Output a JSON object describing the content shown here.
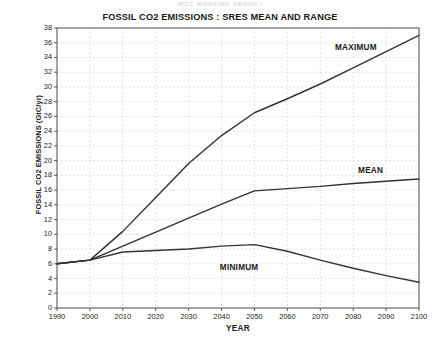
{
  "figure": {
    "faint_header": "IPCC WORKING GROUP I",
    "title": "FOSSIL CO2 EMISSIONS : SRES MEAN AND RANGE",
    "background_color": "#ffffff",
    "line_color": "#333333",
    "grid_color": "#cccccc"
  },
  "axes": {
    "x_title": "YEAR",
    "y_title": "FOSSIL CO2 EMISSIONS  (GtC/yr)",
    "x_ticks": [
      "1990",
      "2000",
      "2010",
      "2020",
      "2030",
      "2040",
      "2050",
      "2060",
      "2070",
      "2080",
      "2090",
      "2100"
    ],
    "y_ticks": [
      "38",
      "36",
      "34",
      "32",
      "30",
      "28",
      "26",
      "24",
      "22",
      "20",
      "18",
      "16",
      "14",
      "12",
      "10",
      "8",
      "6",
      "4",
      "2",
      "0"
    ]
  },
  "series_labels": {
    "maximum": "MAXIMUM",
    "mean": "MEAN",
    "minimum": "MINIMUM"
  },
  "chart_data": {
    "type": "line",
    "title": "FOSSIL CO2 EMISSIONS : SRES MEAN AND RANGE",
    "xlabel": "YEAR",
    "ylabel": "FOSSIL CO2 EMISSIONS  (GtC/yr)",
    "xlim": [
      1990,
      2100
    ],
    "ylim": [
      0,
      38
    ],
    "xticks": [
      1990,
      2000,
      2010,
      2020,
      2030,
      2040,
      2050,
      2060,
      2070,
      2080,
      2090,
      2100
    ],
    "yticks": [
      0,
      2,
      4,
      6,
      8,
      10,
      12,
      14,
      16,
      18,
      20,
      22,
      24,
      26,
      28,
      30,
      32,
      34,
      36,
      38
    ],
    "grid": true,
    "legend": "inline-annotations",
    "x": [
      1990,
      2000,
      2010,
      2020,
      2030,
      2040,
      2050,
      2060,
      2070,
      2080,
      2090,
      2100
    ],
    "series": [
      {
        "name": "MAXIMUM",
        "values": [
          6.0,
          6.5,
          10.4,
          15.0,
          19.6,
          23.4,
          26.5,
          28.4,
          30.4,
          32.6,
          34.8,
          37.0
        ],
        "label_position": {
          "x": 2083,
          "y": 35.3
        }
      },
      {
        "name": "MEAN",
        "values": [
          6.0,
          6.5,
          8.4,
          10.3,
          12.2,
          14.1,
          15.9,
          16.2,
          16.5,
          16.9,
          17.2,
          17.5
        ],
        "label_position": {
          "x": 2090,
          "y": 18.6
        }
      },
      {
        "name": "MINIMUM",
        "values": [
          6.0,
          6.5,
          7.6,
          7.8,
          8.0,
          8.4,
          8.6,
          7.7,
          6.5,
          5.4,
          4.4,
          3.5
        ],
        "label_position": {
          "x": 2048,
          "y": 5.4
        }
      }
    ]
  }
}
